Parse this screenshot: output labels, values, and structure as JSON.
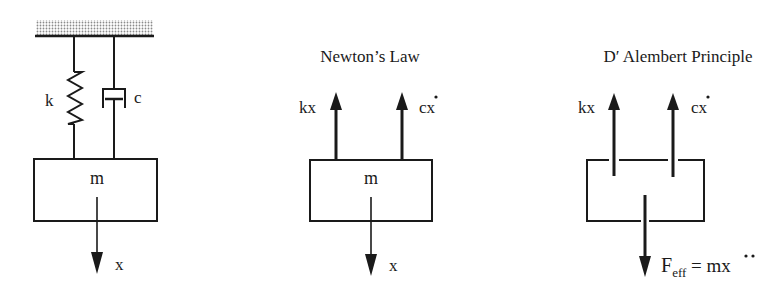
{
  "diagrams": {
    "system": {
      "spring_label": "k",
      "damper_label": "c",
      "mass_label": "m",
      "displacement_label": "x"
    },
    "newton": {
      "title": "Newton’s Law",
      "mass_label": "m",
      "spring_force": "kx",
      "damper_force": "cx",
      "damper_force_dot": "˙",
      "displacement_label": "x"
    },
    "dalembert": {
      "title": "D′ Alembert Principle",
      "spring_force": "kx",
      "damper_force": "cx",
      "damper_force_dot": "˙",
      "inertia_force_main": "F",
      "inertia_force_sub": "eff",
      "inertia_force_eq": " = mx",
      "inertia_force_ddot": "¨"
    }
  },
  "colors": {
    "ink": "#1a1a1a",
    "background": "#ffffff",
    "hatch": "#9a9a9a"
  }
}
